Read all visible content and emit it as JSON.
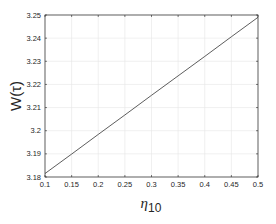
{
  "chart_data": {
    "type": "line",
    "title": "",
    "xlabel": "η10",
    "xlabel_base": "η",
    "xlabel_sub": "10",
    "ylabel": "W(τ)",
    "xlim": [
      0.1,
      0.5
    ],
    "ylim": [
      3.18,
      3.25
    ],
    "grid": true,
    "legend": null,
    "xticks": [
      "0.1",
      "0.15",
      "0.2",
      "0.25",
      "0.3",
      "0.35",
      "0.4",
      "0.45",
      "0.5"
    ],
    "yticks": [
      "3.18",
      "3.19",
      "3.2",
      "3.21",
      "3.22",
      "3.23",
      "3.24",
      "3.25"
    ],
    "series": [
      {
        "name": "W(τ)",
        "color": "#333333",
        "x": [
          0.1,
          0.15,
          0.2,
          0.25,
          0.3,
          0.35,
          0.4,
          0.45,
          0.5
        ],
        "y": [
          3.1815,
          3.1899,
          3.1984,
          3.2068,
          3.2153,
          3.2237,
          3.2321,
          3.2406,
          3.249
        ]
      }
    ]
  }
}
